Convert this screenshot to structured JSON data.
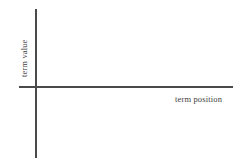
{
  "figure": {
    "background_color": "#ffffff",
    "axis_color": "#4a4a4a",
    "label_color": "#3d3d3d"
  },
  "chart_data": {
    "type": "line",
    "title": "",
    "subtitle": "",
    "xlabel": "term position",
    "ylabel": "term value",
    "series": [],
    "categories": [],
    "values": [],
    "x_tick_labels": [],
    "y_tick_labels": [],
    "grid": false,
    "legend": false,
    "legend_position": "none",
    "annotations": []
  }
}
